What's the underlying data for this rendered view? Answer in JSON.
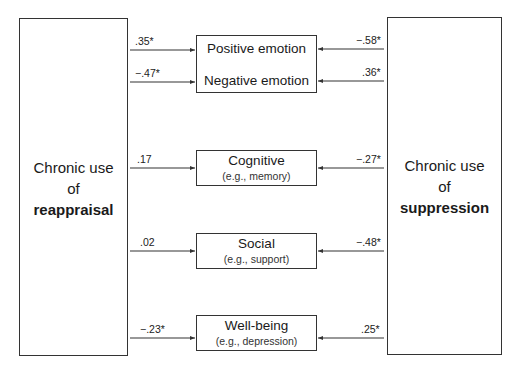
{
  "left_construct": {
    "line1": "Chronic use",
    "line2": "of",
    "line3": "reappraisal"
  },
  "right_construct": {
    "line1": "Chronic use",
    "line2": "of",
    "line3": "suppression"
  },
  "outcomes": [
    {
      "id": "positive-emotion",
      "title": "Positive emotion",
      "subtitle": "",
      "left_coef": ".35*",
      "right_coef": "−.58*"
    },
    {
      "id": "negative-emotion",
      "title": "Negative emotion",
      "subtitle": "",
      "left_coef": "−.47*",
      "right_coef": ".36*"
    },
    {
      "id": "cognitive",
      "title": "Cognitive",
      "subtitle": "(e.g., memory)",
      "left_coef": ".17",
      "right_coef": "−.27*"
    },
    {
      "id": "social",
      "title": "Social",
      "subtitle": "(e.g., support)",
      "left_coef": ".02",
      "right_coef": "−.48*"
    },
    {
      "id": "well-being",
      "title": "Well-being",
      "subtitle": "(e.g., depression)",
      "left_coef": "−.23*",
      "right_coef": ".25*"
    }
  ],
  "colors": {
    "line": "#333333",
    "text": "#1a1a1a"
  }
}
